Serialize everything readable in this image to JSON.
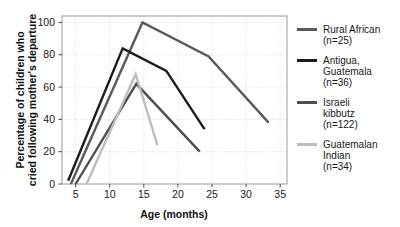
{
  "chart_data": {
    "type": "line",
    "title": "",
    "xlabel": "Age (months)",
    "ylabel": "Percentage of children who cried following mother's departure",
    "xlim": [
      3,
      36
    ],
    "ylim": [
      0,
      104
    ],
    "xticks": [
      5,
      10,
      15,
      20,
      25,
      30,
      35
    ],
    "yticks": [
      0,
      20,
      40,
      60,
      80,
      100
    ],
    "grid": true,
    "legend_position": "right",
    "series": [
      {
        "name": "Rural African",
        "n_label": "(n=25)",
        "legend_lines": [
          "Rural African",
          "(n=25)"
        ],
        "color": "#5a5a5a",
        "points": [
          [
            4.3,
            0
          ],
          [
            14.8,
            100
          ],
          [
            24.5,
            79
          ],
          [
            33.3,
            38
          ]
        ]
      },
      {
        "name": "Antigua, Guatemala",
        "n_label": "(n=36)",
        "legend_lines": [
          "Antigua,",
          "Guatemala",
          "(n=36)"
        ],
        "color": "#1c1c1c",
        "points": [
          [
            3.9,
            2
          ],
          [
            11.9,
            84
          ],
          [
            18.3,
            70
          ],
          [
            23.9,
            34
          ]
        ]
      },
      {
        "name": "Israeli kibbutz",
        "n_label": "(n=122)",
        "legend_lines": [
          "Israeli",
          "kibbutz",
          "(n=122)"
        ],
        "color": "#4f4f4f",
        "points": [
          [
            5.0,
            0
          ],
          [
            13.9,
            62
          ],
          [
            23.2,
            20
          ]
        ]
      },
      {
        "name": "Guatemalan Indian",
        "n_label": "(n=34)",
        "legend_lines": [
          "Guatemalan",
          "Indian",
          "(n=34)"
        ],
        "color": "#bdbdbd",
        "points": [
          [
            6.6,
            0
          ],
          [
            13.8,
            68
          ],
          [
            17.0,
            24
          ]
        ]
      }
    ]
  },
  "axes": {
    "xlabel": "Age (months)",
    "ylabel_line1": "Percentage of children who",
    "ylabel_line2": "cried following mother's departure"
  }
}
